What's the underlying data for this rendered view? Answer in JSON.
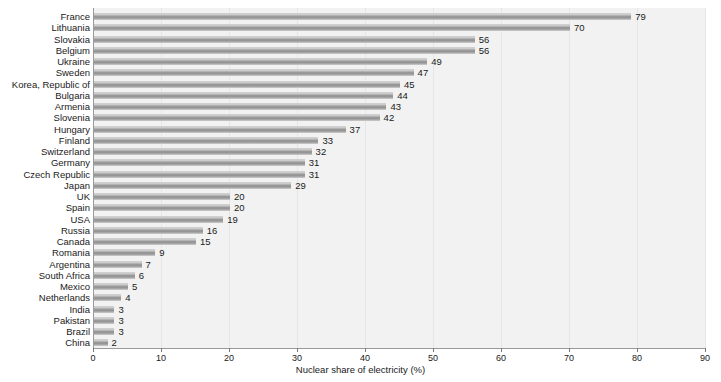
{
  "chart_data": {
    "type": "bar",
    "orientation": "horizontal",
    "title": "",
    "xlabel": "Nuclear share of electricity (%)",
    "ylabel": "",
    "xlim": [
      0,
      90
    ],
    "xticks": [
      0,
      10,
      20,
      30,
      40,
      50,
      60,
      70,
      80,
      90
    ],
    "grid": true,
    "legend": false,
    "bar_color": "#8d8d8d",
    "panel_color": "#f2f2f2",
    "value_labels": true,
    "categories": [
      "France",
      "Lithuania",
      "Slovakia",
      "Belgium",
      "Ukraine",
      "Sweden",
      "Korea, Republic of",
      "Bulgaria",
      "Armenia",
      "Slovenia",
      "Hungary",
      "Finland",
      "Switzerland",
      "Germany",
      "Czech Republic",
      "Japan",
      "UK",
      "Spain",
      "USA",
      "Russia",
      "Canada",
      "Romania",
      "Argentina",
      "South Africa",
      "Mexico",
      "Netherlands",
      "India",
      "Pakistan",
      "Brazil",
      "China"
    ],
    "values": [
      79,
      70,
      56,
      56,
      49,
      47,
      45,
      44,
      43,
      42,
      37,
      33,
      32,
      31,
      31,
      29,
      20,
      20,
      19,
      16,
      15,
      9,
      7,
      6,
      5,
      4,
      3,
      3,
      3,
      2
    ]
  }
}
